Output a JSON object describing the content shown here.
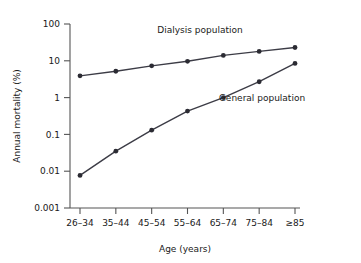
{
  "chart_data": {
    "type": "line",
    "title": "",
    "xlabel": "Age (years)",
    "ylabel": "Annual mortality (%)",
    "categories": [
      "26–34",
      "35–44",
      "45–54",
      "55–64",
      "65–74",
      "75–84",
      "≥85"
    ],
    "yscale": "log",
    "ylim": [
      0.001,
      100
    ],
    "yticks": [
      0.001,
      0.01,
      0.1,
      1,
      10,
      100
    ],
    "ytick_labels": [
      "0.001",
      "0.01",
      "0.1",
      "1",
      "10",
      "100"
    ],
    "grid": false,
    "legend_position": "inline-annotations",
    "line_color": "#3c3c46",
    "marker_color": "#2b2b33",
    "axis_color": "#555555",
    "series": [
      {
        "name": "Dialysis population",
        "label": "Dialysis population",
        "values": [
          3.9,
          5.2,
          7.3,
          9.7,
          14,
          18,
          23
        ]
      },
      {
        "name": "General population",
        "label": "General population",
        "values": [
          0.0077,
          0.035,
          0.13,
          0.43,
          1.0,
          2.7,
          8.5
        ]
      }
    ],
    "annotations": [
      {
        "text": "Dialysis population",
        "x_px": 200,
        "y_px": 33
      },
      {
        "text": "General population",
        "x_px": 262,
        "y_px": 101
      }
    ]
  }
}
